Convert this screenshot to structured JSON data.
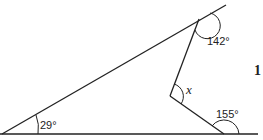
{
  "diagram": {
    "type": "geometry-angles",
    "angles": {
      "bottom_left": "29°",
      "top_right": "142°",
      "inner": "x",
      "bottom_right": "155°"
    },
    "question_number": "1"
  }
}
